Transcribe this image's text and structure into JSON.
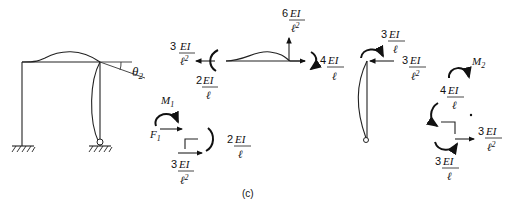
{
  "figure": {
    "caption": "(c)",
    "frame": {
      "rotation_label": "θ",
      "rotation_sub": "2"
    },
    "beam_fbd": {
      "left_force": {
        "coef": "3",
        "num": "EI",
        "den": "ℓ",
        "den_exp": "2"
      },
      "left_moment": {
        "coef": "2",
        "num": "EI",
        "den": "ℓ"
      },
      "right_shear": {
        "coef": "6",
        "num": "EI",
        "den": "ℓ",
        "den_exp": "2"
      },
      "right_moment": {
        "coef": "4",
        "num": "EI",
        "den": "ℓ"
      }
    },
    "left_joint": {
      "moment_label": "M",
      "moment_sub": "1",
      "force_label": "F",
      "force_sub": "1",
      "moment": {
        "coef": "2",
        "num": "EI",
        "den": "ℓ"
      },
      "force": {
        "coef": "3",
        "num": "EI",
        "den": "ℓ",
        "den_exp": "2"
      }
    },
    "column_fbd": {
      "top_moment": {
        "coef": "3",
        "num": "EI",
        "den": "ℓ"
      },
      "top_force": {
        "coef": "3",
        "num": "EI",
        "den": "ℓ",
        "den_exp": "2"
      }
    },
    "right_joint": {
      "moment_label": "M",
      "moment_sub": "2",
      "beam_moment": {
        "coef": "4",
        "num": "EI",
        "den": "ℓ"
      },
      "force": {
        "coef": "3",
        "num": "EI",
        "den": "ℓ",
        "den_exp": "2"
      },
      "column_moment": {
        "coef": "3",
        "num": "EI",
        "den": "ℓ"
      }
    }
  }
}
